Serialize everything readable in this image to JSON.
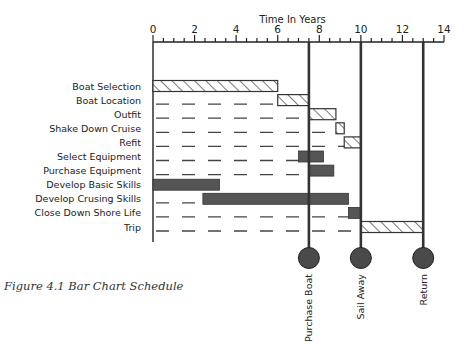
{
  "caption": "Figure 4.1 Bar Chart Schedule",
  "chart_data": {
    "type": "bar",
    "orientation": "horizontal-gantt",
    "title": "Time In Years",
    "xlabel": "Time In Years",
    "xlim": [
      0,
      14
    ],
    "x_ticks": [
      0,
      2,
      4,
      6,
      8,
      10,
      12,
      14
    ],
    "minor_tick_step": 0.5,
    "grid": false,
    "tasks": [
      {
        "label": "Boat Selection",
        "start": 0,
        "end": 6.0,
        "style": "hatched",
        "dashed_guide": false
      },
      {
        "label": "Boat Location",
        "start": 6.0,
        "end": 7.5,
        "style": "hatched",
        "dashed_guide": true
      },
      {
        "label": "Outfit",
        "start": 7.5,
        "end": 8.8,
        "style": "hatched",
        "dashed_guide": true
      },
      {
        "label": "Shake Down Cruise",
        "start": 8.8,
        "end": 9.2,
        "style": "hatched",
        "dashed_guide": true
      },
      {
        "label": "Refit",
        "start": 9.2,
        "end": 10.0,
        "style": "hatched",
        "dashed_guide": true
      },
      {
        "label": "Select Equipment",
        "start": 7.0,
        "end": 8.2,
        "style": "solid",
        "dashed_guide": true
      },
      {
        "label": "Purchase Equipment",
        "start": 7.5,
        "end": 8.7,
        "style": "solid",
        "dashed_guide": true
      },
      {
        "label": "Develop Basic Skills",
        "start": 0,
        "end": 3.2,
        "style": "solid",
        "dashed_guide": false
      },
      {
        "label": "Develop Crusing Skills",
        "start": 2.4,
        "end": 9.4,
        "style": "solid",
        "dashed_guide": true
      },
      {
        "label": "Close Down Shore Life",
        "start": 9.4,
        "end": 10.0,
        "style": "solid",
        "dashed_guide": true
      },
      {
        "label": "Trip",
        "start": 10.0,
        "end": 13.0,
        "style": "hatched",
        "dashed_guide": true
      }
    ],
    "milestones": [
      {
        "label": "Purchase Boat",
        "x": 7.5
      },
      {
        "label": "Sail Away",
        "x": 10
      },
      {
        "label": "Return",
        "x": 13
      }
    ],
    "colors": {
      "solid_bar": "#555555",
      "hatch": "#333333",
      "axis": "#222222",
      "milestone": "#4a4a4a"
    }
  }
}
